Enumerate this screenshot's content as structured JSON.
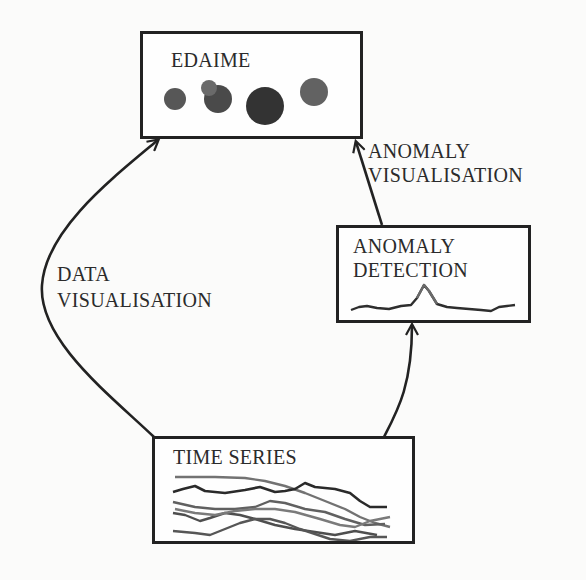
{
  "diagram": {
    "nodes": {
      "edaime": {
        "title": "EDAIME"
      },
      "anomaly_detection": {
        "title_line1": "ANOMALY",
        "title_line2": "DETECTION"
      },
      "time_series": {
        "title": "TIME SERIES"
      }
    },
    "edges": {
      "data_visualisation": {
        "from": "TIME SERIES",
        "to": "EDAIME",
        "label_line1": "DATA",
        "label_line2": "VISUALISATION"
      },
      "anomaly_visualisation": {
        "from": "ANOMALY DETECTION",
        "to": "EDAIME",
        "label_line1": "ANOMALY",
        "label_line2": "VISUALISATION"
      },
      "time_series_to_detection": {
        "from": "TIME SERIES",
        "to": "ANOMALY DETECTION"
      }
    },
    "colors": {
      "stroke": "#222222",
      "dot_dark": "#3a3a3a",
      "dot_mid": "#555555",
      "dot_light": "#6e6e6e",
      "series_dark": "#2a2a2a",
      "series_mid": "#6a6a6a"
    }
  }
}
